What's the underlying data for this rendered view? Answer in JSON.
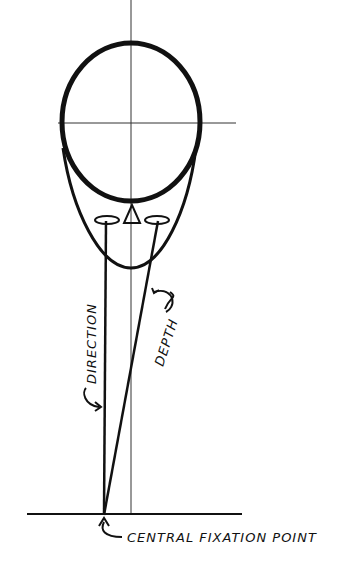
{
  "diagram": {
    "labels": {
      "direction": "DIRECTION",
      "depth": "DEPTH",
      "fixation": "CENTRAL FIXATION POINT"
    },
    "colors": {
      "ink": "#111111",
      "background": "#ffffff"
    }
  }
}
